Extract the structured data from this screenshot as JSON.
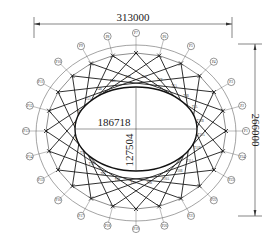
{
  "drawing": {
    "type": "elliptical roof truss plan",
    "colors": {
      "line": "#1a1a1a",
      "thin_line": "#555555",
      "background": "#ffffff"
    },
    "outer_ellipse": {
      "cx": 136,
      "cy": 133,
      "rx": 100,
      "ry": 88
    },
    "inner_ellipse": {
      "cx": 136,
      "cy": 129,
      "rx": 61,
      "ry": 42
    },
    "truss_ring": {
      "cx": 136,
      "cy": 131,
      "rx": 90,
      "ry": 78
    },
    "node_count": 24,
    "truss_skip": 7
  },
  "dimensions": {
    "overall_width": "313000",
    "overall_height": "266000",
    "inner_width": "186718",
    "inner_height": "127504"
  },
  "nodes": [
    "P1",
    "P2",
    "P3",
    "P4",
    "P5",
    "P6",
    "P7",
    "P8",
    "P9",
    "P10",
    "P11",
    "P12",
    "P13",
    "P14",
    "P15",
    "P16",
    "P17",
    "P18",
    "P19",
    "P20",
    "P21",
    "P22",
    "P23",
    "P24"
  ],
  "member_labels": [
    "T1A",
    "T1B",
    "T2A",
    "T2B",
    "T3A",
    "T3B",
    "T4A",
    "T4B",
    "T5A",
    "T5B",
    "T6A",
    "T6B",
    "T7A",
    "T7B",
    "T8A",
    "T8B",
    "T9A",
    "T9B",
    "T10A",
    "T10B",
    "T11A",
    "T11B",
    "T12A",
    "T12B"
  ]
}
